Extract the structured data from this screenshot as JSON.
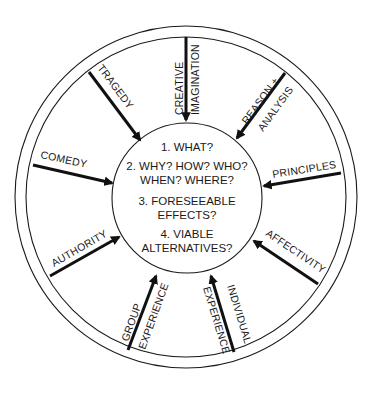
{
  "diagram": {
    "center_questions": [
      {
        "lines": [
          "1. WHAT?"
        ]
      },
      {
        "lines": [
          "2. WHY? HOW? WHO?",
          "WHEN? WHERE?"
        ]
      },
      {
        "lines": [
          "3. FORESEEABLE",
          "EFFECTS?"
        ]
      },
      {
        "lines": [
          "4. VIABLE",
          "ALTERNATIVES?"
        ]
      }
    ],
    "sources": [
      {
        "id": "creative-imagination",
        "lines": [
          "CREATIVE",
          "IMAGINATION"
        ]
      },
      {
        "id": "reason-analysis",
        "lines": [
          "REASON +",
          "ANALYSIS"
        ]
      },
      {
        "id": "principles",
        "lines": [
          "PRINCIPLES"
        ]
      },
      {
        "id": "affectivity",
        "lines": [
          "AFFECTIVITY"
        ]
      },
      {
        "id": "individual-experience",
        "lines": [
          "INDIVIDUAL",
          "EXPERIENCE"
        ]
      },
      {
        "id": "group-experience",
        "lines": [
          "GROUP",
          "EXPERIENCE"
        ]
      },
      {
        "id": "authority",
        "lines": [
          "AUTHORITY"
        ]
      },
      {
        "id": "comedy",
        "lines": [
          "COMEDY"
        ]
      },
      {
        "id": "tragedy",
        "lines": [
          "TRAGEDY"
        ]
      }
    ],
    "colors": {
      "stroke": "#111111",
      "background": "#ffffff"
    }
  }
}
